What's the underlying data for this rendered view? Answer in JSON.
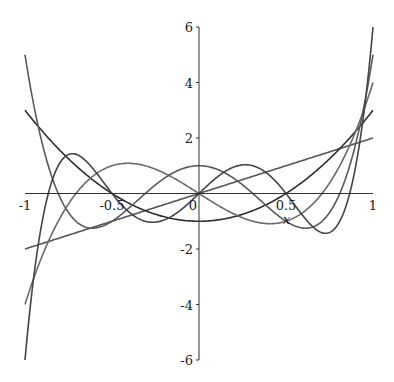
{
  "chart_data": {
    "type": "line",
    "title": "",
    "xlabel": "x",
    "ylabel": "",
    "xlim": [
      -1,
      1
    ],
    "ylim": [
      -6,
      6
    ],
    "grid": false,
    "legend": null,
    "x_ticks": [
      "-1",
      "-0.5",
      "0",
      "0.5",
      "1"
    ],
    "y_ticks": [
      "6",
      "4",
      "2",
      "-2",
      "-4",
      "-6"
    ],
    "series": [
      {
        "name": "U1(x) = 2x",
        "coefficients_desc": [
          2,
          0
        ],
        "color": "#555555",
        "x": [
          -1,
          -0.5,
          0,
          0.5,
          1
        ],
        "values": [
          -2,
          -1,
          0,
          1,
          2
        ]
      },
      {
        "name": "U2(x) = 4x^2 - 1",
        "coefficients_desc": [
          4,
          0,
          -1
        ],
        "color": "#2e2e2e",
        "x": [
          -1,
          -0.5,
          0,
          0.5,
          1
        ],
        "values": [
          3,
          0,
          -1,
          0,
          3
        ]
      },
      {
        "name": "U3(x) = 8x^3 - 4x",
        "coefficients_desc": [
          8,
          0,
          -4,
          0
        ],
        "color": "#6a6a6a",
        "x": [
          -1,
          -0.5,
          0,
          0.5,
          1
        ],
        "values": [
          -4,
          1,
          0,
          -1,
          4
        ]
      },
      {
        "name": "U4(x) = 16x^4 - 12x^2 + 1",
        "coefficients_desc": [
          16,
          0,
          -12,
          0,
          1
        ],
        "color": "#5a5a5a",
        "x": [
          -1,
          -0.5,
          0,
          0.5,
          1
        ],
        "values": [
          5,
          -1,
          1,
          -1,
          5
        ]
      },
      {
        "name": "U5(x) = 32x^5 - 32x^3 + 6x",
        "coefficients_desc": [
          32,
          0,
          -32,
          0,
          6,
          0
        ],
        "color": "#444444",
        "x": [
          -1,
          -0.5,
          0,
          0.5,
          1
        ],
        "values": [
          -6,
          0,
          0,
          0,
          6
        ]
      }
    ]
  }
}
